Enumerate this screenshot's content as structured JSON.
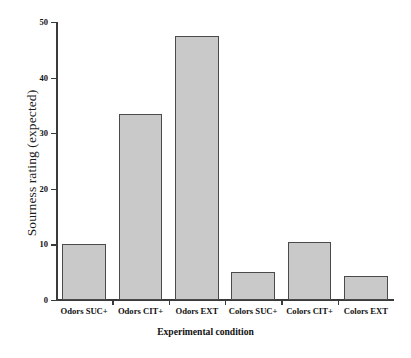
{
  "chart_data": {
    "type": "bar",
    "title": "",
    "xlabel": "Experimental condition",
    "ylabel": "Sourness rating (expected)",
    "categories": [
      "Odors  SUC+",
      "Odors CIT+",
      "Odors EXT",
      "Colors SUC+",
      "Colors CIT+",
      "Colors EXT"
    ],
    "values": [
      10,
      33.5,
      47.5,
      5,
      10.5,
      4.3
    ],
    "ylim": [
      0,
      50
    ],
    "yticks": [
      0,
      10,
      20,
      30,
      40,
      50
    ],
    "ytick_labels": [
      "0",
      "10",
      "20",
      "30",
      "40",
      "50"
    ],
    "grid": false,
    "legend": null,
    "bar_color": "#c9c9c9",
    "bar_edge_color": "#4a4a4a",
    "axis_color": "#3a3a3a"
  }
}
